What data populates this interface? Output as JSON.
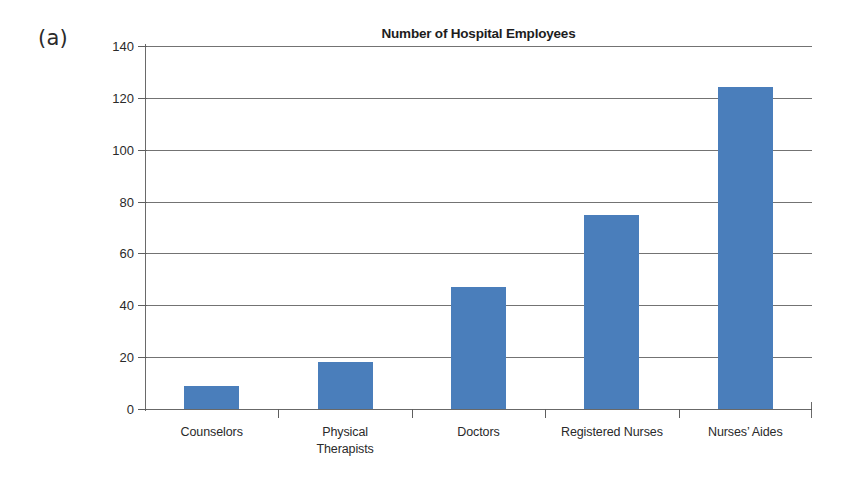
{
  "panel_label": "(a)",
  "colors": {
    "bar": "#4a7ebb",
    "axis": "#5e5e5e",
    "gridline": "#5b5b5b",
    "text": "#231f20",
    "background": "#ffffff"
  },
  "chart_data": {
    "type": "bar",
    "title": "Number of Hospital Employees",
    "xlabel": "",
    "ylabel": "",
    "categories": [
      "Counselors",
      "Physical Therapists",
      "Doctors",
      "Registered Nurses",
      "Nurses’ Aides"
    ],
    "category_lines": [
      [
        "Counselors"
      ],
      [
        "Physical",
        "Therapists"
      ],
      [
        "Doctors"
      ],
      [
        "Registered Nurses"
      ],
      [
        "Nurses’ Aides"
      ]
    ],
    "values": [
      9,
      18,
      47,
      75,
      124
    ],
    "ylim": [
      0,
      140
    ],
    "ytick_step": 20,
    "yticks": [
      0,
      20,
      40,
      60,
      80,
      100,
      120,
      140
    ],
    "ytick_labels": [
      "0",
      "20",
      "40",
      "60",
      "80",
      "100",
      "120",
      "140"
    ],
    "grid": true,
    "grid_axis": "y",
    "legend": false,
    "legend_position": "none",
    "series": [
      {
        "name": "Number of Hospital Employees",
        "values": [
          9,
          18,
          47,
          75,
          124
        ]
      }
    ]
  }
}
